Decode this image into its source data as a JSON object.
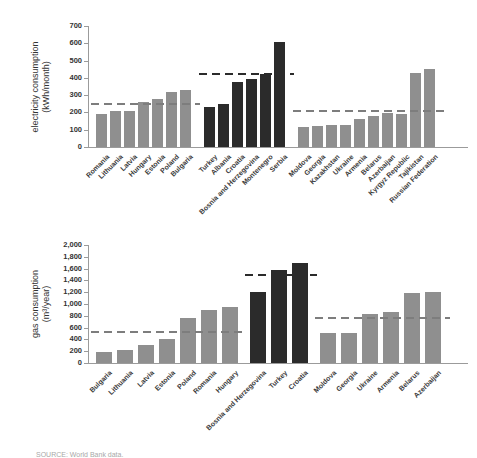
{
  "figure": {
    "source_note": "SOURCE: World Bank data."
  },
  "colors": {
    "background": "#ffffff",
    "bar_gray": "#8f8f8f",
    "bar_dark": "#2b2b2b",
    "dash_gray": "#7d7d7d",
    "dash_dark": "#2b2b2b",
    "axis": "#9b9b9b",
    "tick_text": "#333333",
    "label_text": "#3c3c3c",
    "source_text": "#a8a8a8"
  },
  "chart_data": [
    {
      "type": "bar",
      "title": "",
      "ylabel": "electricity consumption (kWh/month)",
      "ylabel_lines": [
        "electricity consumption",
        "(kWh/month)"
      ],
      "ylim": [
        0,
        700
      ],
      "ytick_interval": 100,
      "ytick_labels": [
        "700",
        "600",
        "500",
        "400",
        "300",
        "200",
        "100",
        "0"
      ],
      "grid": false,
      "legend": "none",
      "groups": [
        {
          "bar_color": "gray",
          "mean_dash_value": 250,
          "categories": [
            "Romania",
            "Lithuania",
            "Latvia",
            "Hungary",
            "Estonia",
            "Poland",
            "Bulgaria"
          ],
          "values": [
            190,
            210,
            210,
            260,
            280,
            320,
            330
          ]
        },
        {
          "bar_color": "dark",
          "mean_dash_value": 420,
          "categories": [
            "Turkey",
            "Albania",
            "Croatia",
            "Bosnia and Herzegovina",
            "Montenegro",
            "Serbia"
          ],
          "values": [
            230,
            250,
            375,
            395,
            420,
            610
          ]
        },
        {
          "bar_color": "gray",
          "mean_dash_value": 210,
          "categories": [
            "Moldova",
            "Georgia",
            "Kazakhstan",
            "Ukraine",
            "Armenia",
            "Belarus",
            "Azerbaijan",
            "Kyrgyz Republic",
            "Tajikistan",
            "Russian Federation"
          ],
          "values": [
            115,
            120,
            125,
            130,
            160,
            180,
            195,
            190,
            430,
            450
          ]
        }
      ]
    },
    {
      "type": "bar",
      "title": "",
      "ylabel": "gas consumption (m³/year)",
      "ylabel_lines": [
        "gas consumption",
        "(m³/year)"
      ],
      "ylim": [
        0,
        2000
      ],
      "ytick_interval": 200,
      "ytick_labels": [
        "2,000",
        "1,800",
        "1,600",
        "1,400",
        "1,200",
        "1,000",
        "800",
        "600",
        "400",
        "200",
        "0"
      ],
      "grid": false,
      "legend": "none",
      "groups": [
        {
          "bar_color": "gray",
          "mean_dash_value": 530,
          "categories": [
            "Bulgaria",
            "Lithuania",
            "Latvia",
            "Estonia",
            "Poland",
            "Romania",
            "Hungary"
          ],
          "values": [
            180,
            220,
            300,
            400,
            770,
            900,
            950
          ]
        },
        {
          "bar_color": "dark",
          "mean_dash_value": 1500,
          "categories": [
            "Bosnia and Herzegovina",
            "Turkey",
            "Croatia"
          ],
          "values": [
            1200,
            1570,
            1700
          ]
        },
        {
          "bar_color": "gray",
          "mean_dash_value": 770,
          "categories": [
            "Moldova",
            "Georgia",
            "Ukraine",
            "Armenia",
            "Belarus",
            "Azerbaijan"
          ],
          "values": [
            510,
            510,
            830,
            860,
            1180,
            1210
          ]
        }
      ]
    }
  ]
}
